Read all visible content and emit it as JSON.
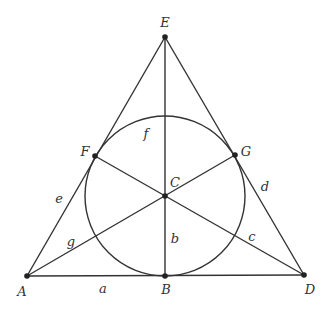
{
  "diagram": {
    "points": [
      {
        "id": "A",
        "label": "A",
        "x": 27,
        "y": 276,
        "lx": 22,
        "ly": 296
      },
      {
        "id": "B",
        "label": "B",
        "x": 165,
        "y": 276,
        "lx": 166,
        "ly": 294
      },
      {
        "id": "C",
        "label": "C",
        "x": 165,
        "y": 196,
        "lx": 175,
        "ly": 187
      },
      {
        "id": "D",
        "label": "D",
        "x": 304,
        "y": 275,
        "lx": 310,
        "ly": 294
      },
      {
        "id": "E",
        "label": "E",
        "x": 165,
        "y": 37,
        "lx": 165,
        "ly": 27
      },
      {
        "id": "F",
        "label": "F",
        "x": 95,
        "y": 156,
        "lx": 85,
        "ly": 156
      },
      {
        "id": "G",
        "label": "G",
        "x": 235,
        "y": 155,
        "lx": 246,
        "ly": 156
      }
    ],
    "lines": [
      {
        "id": "a",
        "label": "a",
        "from": "A",
        "to": "D",
        "lx": 103,
        "ly": 293
      },
      {
        "id": "b",
        "label": "b",
        "from": "E",
        "to": "B",
        "lx": 175,
        "ly": 243
      },
      {
        "id": "c",
        "label": "c",
        "from": "F",
        "to": "D",
        "lx": 252,
        "ly": 241
      },
      {
        "id": "d",
        "label": "d",
        "from": "E",
        "to": "D",
        "lx": 265,
        "ly": 191
      },
      {
        "id": "e",
        "label": "e",
        "from": "E",
        "to": "A",
        "lx": 59,
        "ly": 203
      },
      {
        "id": "g",
        "label": "g",
        "from": "A",
        "to": "G",
        "lx": 71,
        "ly": 246
      }
    ],
    "circle": {
      "id": "f",
      "label": "f",
      "cx": 165,
      "cy": 196,
      "r": 80,
      "lx": 146,
      "ly": 138
    },
    "colors": {
      "stroke": "#333333",
      "point": "#222222",
      "background": "#ffffff"
    }
  }
}
